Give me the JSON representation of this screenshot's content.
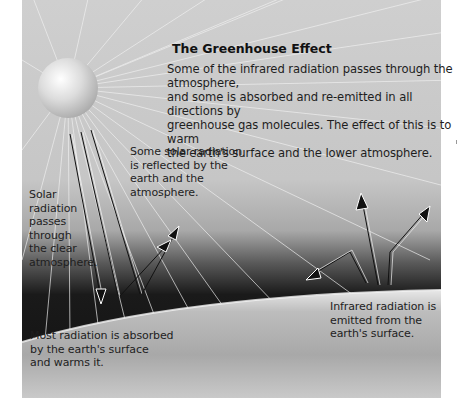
{
  "diagram": {
    "title": "The Greenhouse Effect",
    "intro_text": "Some of the infrared radiation passes through the atmosphere,\nand some is absorbed and re-emitted in all directions by\ngreenhouse gas molecules. The effect of this is to warm\nthe earth's surface and the lower atmosphere.",
    "labels": {
      "reflected": "Some solar radiation\nis reflected by the\nearth and the\natmosphere.",
      "passes_through": "Solar\nradiation\npasses\nthrough\nthe clear\natmosphere.",
      "absorbed": "Most radiation is absorbed\nby the earth's surface\nand warms it.",
      "infrared_emitted": "Infrared radiation is\nemitted from the\nearth's surface."
    },
    "elements": {
      "sun": "sun-sphere",
      "earth": "earth-surface",
      "atmosphere": "atmosphere-band",
      "arrows": [
        "incoming-solar-arrow",
        "reflected-solar-arrow",
        "infrared-emitted-arrow",
        "infrared-reemitted-arrow"
      ]
    },
    "colors": {
      "sky_light": "#d6d6d6",
      "sky_mid": "#bdbdbd",
      "atmosphere_dark": "#1e1e1e",
      "earth": "#b8b8b8",
      "text": "#1e1e1e"
    }
  }
}
